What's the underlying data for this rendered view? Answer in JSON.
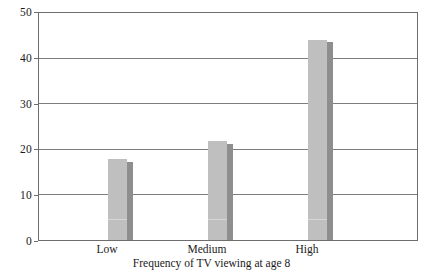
{
  "chart_data": {
    "type": "bar",
    "title": "",
    "xlabel": "Frequency of TV viewing at age 8",
    "ylabel": "",
    "categories": [
      "Low",
      "Medium",
      "High"
    ],
    "series": [
      {
        "name": "light-bar",
        "values": [
          17.9,
          21.8,
          44.3
        ],
        "color": "#bfbfbf"
      },
      {
        "name": "dark-bar",
        "values": [
          17.3,
          21.2,
          43.7
        ],
        "color": "#8e8e8e"
      }
    ],
    "ylim": [
      0,
      50
    ],
    "yticks": [
      0,
      10,
      20,
      30,
      40,
      50
    ],
    "ytick_labels": [
      "0",
      "10",
      "20",
      "30",
      "40",
      "50"
    ],
    "grid": true,
    "legend": "none"
  },
  "axis": {
    "y_labels": [
      "50",
      "40",
      "30",
      "20",
      "10",
      "0"
    ],
    "x_labels": [
      "Low",
      "Medium",
      "High"
    ],
    "x_title": "Frequency of TV viewing at age 8"
  },
  "colors": {
    "bar_light": "#bfbfbf",
    "bar_dark": "#8e8e8e",
    "gridline": "#7d7d7d",
    "frame": "#6e6e6e",
    "background": "#ffffff",
    "text": "#1a1a1a"
  }
}
